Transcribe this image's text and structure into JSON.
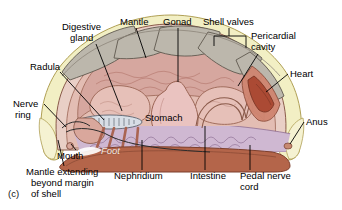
{
  "figure": {
    "id": "(c)",
    "background": "#ffffff"
  },
  "labels": [
    {
      "name": "digestive-gland",
      "text": "Digestive",
      "x": 62,
      "y": 22
    },
    {
      "name": "digestive-gland-2",
      "text": "gland",
      "x": 70,
      "y": 33
    },
    {
      "name": "mantle",
      "text": "Mantle",
      "x": 120,
      "y": 17
    },
    {
      "name": "gonad",
      "text": "Gonad",
      "x": 163,
      "y": 17
    },
    {
      "name": "shell-valves",
      "text": "Shell valves",
      "x": 205,
      "y": 17
    },
    {
      "name": "pericardial-cavity",
      "text": "Pericardial",
      "x": 251,
      "y": 31
    },
    {
      "name": "pericardial-cavity-2",
      "text": "cavity",
      "x": 251,
      "y": 42
    },
    {
      "name": "heart",
      "text": "Heart",
      "x": 290,
      "y": 71
    },
    {
      "name": "radula",
      "text": "Radula",
      "x": 32,
      "y": 63
    },
    {
      "name": "nerve-ring",
      "text": "Nerve",
      "x": 14,
      "y": 101
    },
    {
      "name": "nerve-ring-2",
      "text": "ring",
      "x": 16,
      "y": 112
    },
    {
      "name": "stomach",
      "text": "Stomach",
      "x": 146,
      "y": 115
    },
    {
      "name": "anus",
      "text": "Anus",
      "x": 306,
      "y": 119
    },
    {
      "name": "mouth",
      "text": "Mouth",
      "x": 57,
      "y": 153
    },
    {
      "name": "foot",
      "text": "Foot",
      "x": 101,
      "y": 148
    },
    {
      "name": "mantle-extending",
      "text": "Mantle extending",
      "x": 27,
      "y": 169
    },
    {
      "name": "mantle-extending-2",
      "text": "beyond margin",
      "x": 32,
      "y": 180
    },
    {
      "name": "mantle-extending-3",
      "text": "of shell",
      "x": 32,
      "y": 191
    },
    {
      "name": "nephridium",
      "text": "Nephridium",
      "x": 116,
      "y": 173
    },
    {
      "name": "intestine",
      "text": "Intestine",
      "x": 193,
      "y": 173
    },
    {
      "name": "pedal-nerve-cord",
      "text": "Pedal nerve",
      "x": 243,
      "y": 173
    },
    {
      "name": "pedal-nerve-cord-2",
      "text": "cord",
      "x": 243,
      "y": 184
    }
  ],
  "figure_number": {
    "text": "(c)",
    "x": 8,
    "y": 191
  },
  "colors": {
    "shell_valve": "#b8b3a8",
    "shell_valve_edge": "#6b6660",
    "mantle_yellow": "#f2efc4",
    "mantle_edge": "#b8a85c",
    "body_pink": "#e8c8c0",
    "body_pink_dark": "#d9a99e",
    "gonad": "#cf9b96",
    "stomach": "#e9bfbd",
    "digestive_gland": "#e3b7b2",
    "nephridium": "#cfb8d2",
    "foot": "#b4654a",
    "foot_dark": "#8f4a36",
    "heart": "#b0503a",
    "pericardial": "#c9705a",
    "outline": "#6e4a3e",
    "leader": "#000000"
  }
}
